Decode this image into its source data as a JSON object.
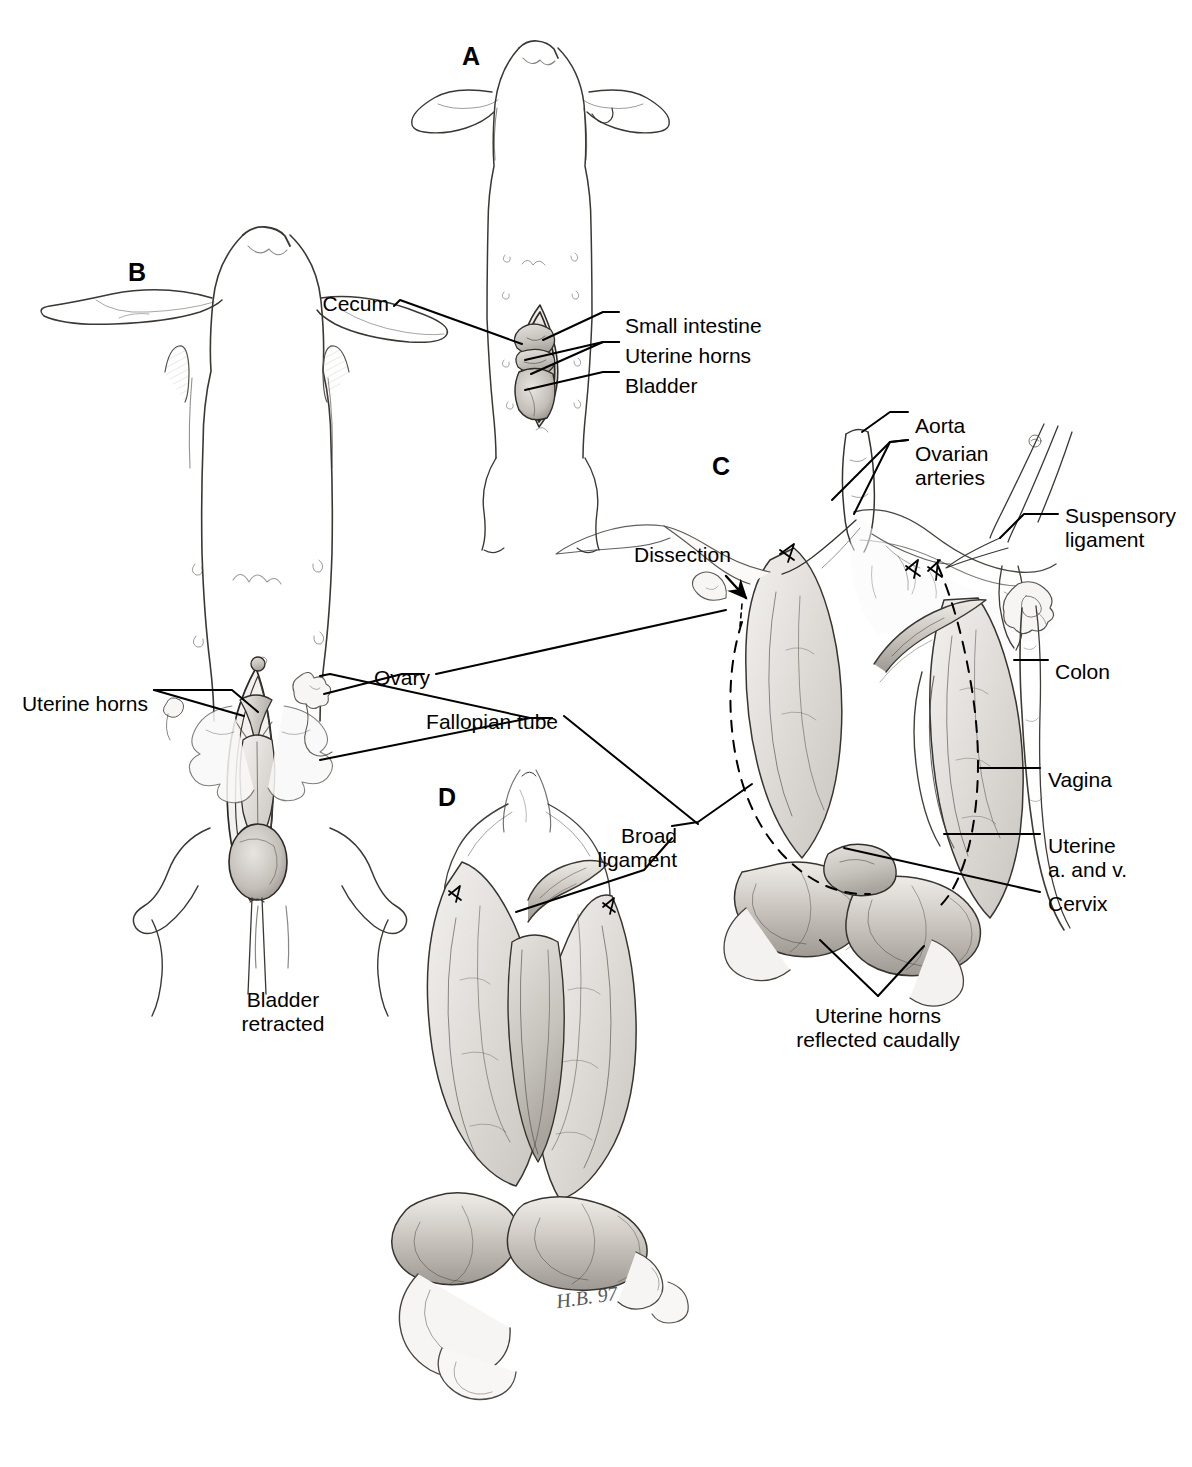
{
  "plate": {
    "title": "Female rat reproductive tract dissection plate",
    "background_color": "#ffffff",
    "ink_color": "#000000",
    "signature": "H.B. 97"
  },
  "panels": [
    {
      "id": "A",
      "letter": "A",
      "caption": "",
      "x": 462,
      "y": 42
    },
    {
      "id": "B",
      "letter": "B",
      "caption": "",
      "x": 128,
      "y": 258
    },
    {
      "id": "C",
      "letter": "C",
      "caption": "",
      "x": 712,
      "y": 452
    },
    {
      "id": "D",
      "letter": "D",
      "caption": "",
      "x": 438,
      "y": 783
    }
  ],
  "labels": {
    "cecum": "Cecum",
    "small_intestine": "Small intestine",
    "uterine_horns": "Uterine horns",
    "bladder": "Bladder",
    "dissection": "Dissection",
    "aorta": "Aorta",
    "ovarian_arteries_l1": "Ovarian",
    "ovarian_arteries_l2": "arteries",
    "suspensory_l1": "Suspensory",
    "suspensory_l2": "ligament",
    "colon": "Colon",
    "vagina": "Vagina",
    "uterine_av_l1": "Uterine",
    "uterine_av_l2": "a. and v.",
    "cervix": "Cervix",
    "uterine_horns_b": "Uterine horns",
    "ovary": "Ovary",
    "fallopian_tube": "Fallopian tube",
    "broad_l1": "Broad",
    "broad_l2": "ligament",
    "bladder_retracted_l1": "Bladder",
    "bladder_retracted_l2": "retracted",
    "horns_reflected_l1": "Uterine horns",
    "horns_reflected_l2": "reflected caudally"
  },
  "callouts": [
    {
      "name": "cecum",
      "text": "Cecum",
      "tx": 389,
      "ty": 302,
      "anchor": "right"
    },
    {
      "name": "small-intestine",
      "text": "Small intestine",
      "tx": 625,
      "ty": 316,
      "anchor": "left"
    },
    {
      "name": "uterine-horns-a",
      "text": "Uterine horns",
      "tx": 625,
      "ty": 345,
      "anchor": "left"
    },
    {
      "name": "bladder",
      "text": "Bladder",
      "tx": 625,
      "ty": 375,
      "anchor": "left"
    },
    {
      "name": "dissection",
      "text": "Dissection",
      "tx": 634,
      "ty": 545,
      "anchor": "left"
    },
    {
      "name": "aorta",
      "text": "Aorta",
      "tx": 915,
      "ty": 416,
      "anchor": "left"
    },
    {
      "name": "ovarian-arteries",
      "text": "Ovarian arteries",
      "tx": 915,
      "ty": 444,
      "anchor": "left"
    },
    {
      "name": "suspensory-ligament",
      "text": "Suspensory ligament",
      "tx": 1065,
      "ty": 506,
      "anchor": "left"
    },
    {
      "name": "colon",
      "text": "Colon",
      "tx": 1055,
      "ty": 662,
      "anchor": "left"
    },
    {
      "name": "vagina",
      "text": "Vagina",
      "tx": 1048,
      "ty": 770,
      "anchor": "left"
    },
    {
      "name": "uterine-a-and-v",
      "text": "Uterine a. and v.",
      "tx": 1048,
      "ty": 836,
      "anchor": "left"
    },
    {
      "name": "cervix",
      "text": "Cervix",
      "tx": 1048,
      "ty": 894,
      "anchor": "left"
    },
    {
      "name": "uterine-horns-b",
      "text": "Uterine horns",
      "tx": 148,
      "ty": 694,
      "anchor": "right"
    },
    {
      "name": "ovary",
      "text": "Ovary",
      "tx": 430,
      "ty": 677,
      "anchor": "right"
    },
    {
      "name": "fallopian-tube",
      "text": "Fallopian tube",
      "tx": 558,
      "ty": 721,
      "anchor": "right"
    },
    {
      "name": "broad-ligament",
      "text": "Broad ligament",
      "tx": 677,
      "ty": 832,
      "anchor": "right"
    },
    {
      "name": "bladder-retracted",
      "text": "Bladder retracted",
      "tx": 283,
      "ty": 997,
      "anchor": "center"
    },
    {
      "name": "horns-reflected",
      "text": "Uterine horns reflected caudally",
      "tx": 878,
      "ty": 1013,
      "anchor": "center"
    }
  ],
  "figure_content": {
    "subject": "laboratory rat, ventral view",
    "panel_a": "intact ventral view of rat with small midline abdominal opening exposing cecum, small intestine, uterine horns and bladder",
    "panel_b": "ventral view with abdominal wall opened wide, bladder retracted caudally, exposing uterine horns, ovary and fallopian tube",
    "panel_c": "close dissection of excised tract showing aorta, ovarian arteries, suspensory ligament grasped with forceps, colon, vagina, uterine artery and vein, cervix, with uterine horns reflected caudally; dashed outlines indicate broad ligament margins and arrows mark cut points",
    "panel_d": "isolated uterus, cervix and vagina with broad ligament, viewed from caudal aspect"
  }
}
